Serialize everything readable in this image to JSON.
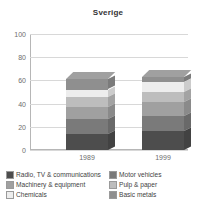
{
  "chart_data": {
    "type": "bar",
    "title": "Sverige",
    "xlabel": "",
    "ylabel": "",
    "ylim": [
      0,
      100
    ],
    "yticks": [
      0,
      20,
      40,
      60,
      80,
      100
    ],
    "grid": true,
    "stacked": true,
    "legend_position": "bottom",
    "categories": [
      "1989",
      "1999"
    ],
    "series": [
      {
        "name": "Radio, TV & communications",
        "color": "#4d4d4d",
        "values": [
          14,
          16
        ]
      },
      {
        "name": "Motor vehicles",
        "color": "#7a7a7a",
        "values": [
          13,
          13
        ]
      },
      {
        "name": "Machinery & equipment",
        "color": "#a0a0a0",
        "values": [
          10,
          12
        ]
      },
      {
        "name": "Pulp & paper",
        "color": "#bdbdbd",
        "values": [
          9,
          9
        ]
      },
      {
        "name": "Chemicals",
        "color": "#ededed",
        "values": [
          6,
          9
        ]
      },
      {
        "name": "Basic metals",
        "color": "#8f8f8f",
        "values": [
          9,
          4
        ]
      }
    ],
    "totals": [
      61,
      63
    ]
  },
  "chart": {
    "title": "Sverige",
    "y_ticks": [
      "100",
      "80",
      "60",
      "40",
      "20",
      "0"
    ],
    "x_labels": [
      "1989",
      "1999"
    ]
  },
  "legend": {
    "left": [
      {
        "label": "Radio, TV & communications",
        "color": "#4d4d4d"
      },
      {
        "label": "Machinery & equipment",
        "color": "#a0a0a0"
      },
      {
        "label": "Chemicals",
        "color": "#ededed"
      }
    ],
    "right": [
      {
        "label": "Motor vehicles",
        "color": "#7a7a7a"
      },
      {
        "label": "Pulp & paper",
        "color": "#bdbdbd"
      },
      {
        "label": "Basic metals",
        "color": "#8f8f8f"
      }
    ]
  }
}
